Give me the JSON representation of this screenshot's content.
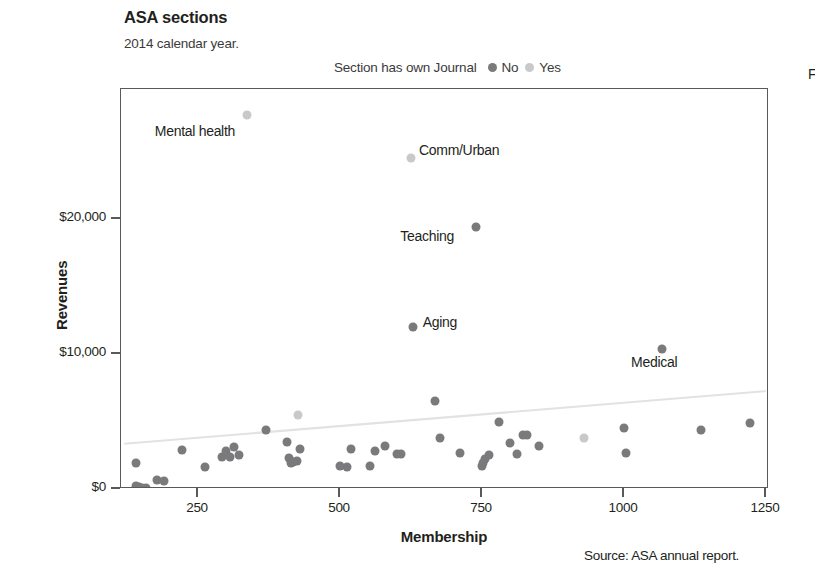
{
  "chart_data": {
    "type": "scatter",
    "title": "ASA sections",
    "subtitle": "2014 calendar year.",
    "xlabel": "Membership",
    "ylabel": "Revenues",
    "source": "Source: ASA annual report.",
    "grid": false,
    "legend_position": "top",
    "legend_title": "Section has own Journal",
    "xlim": [
      120,
      1300
    ],
    "ylim": [
      -1200,
      29000
    ],
    "xticks": [
      250,
      500,
      750,
      1000,
      1250
    ],
    "xtick_labels": [
      "250",
      "500",
      "750",
      "1000",
      "1250"
    ],
    "yticks": [
      0,
      10000,
      20000
    ],
    "ytick_labels": [
      "$0",
      "$10,000",
      "$20,000"
    ],
    "colors": {
      "no": "#7a7a7d",
      "yes": "#c9c9cb",
      "axis": "#58595b",
      "trend": "#e2e2e4",
      "text": "#231f20"
    },
    "series": [
      {
        "name": "No",
        "legend_label": "No",
        "color": "#7a7a7d",
        "points": [
          {
            "x": 140,
            "y": 200
          },
          {
            "x": 146,
            "y": 130
          },
          {
            "x": 152,
            "y": 100
          },
          {
            "x": 158,
            "y": 90
          },
          {
            "x": 140,
            "y": 1900
          },
          {
            "x": 178,
            "y": 700
          },
          {
            "x": 190,
            "y": 600
          },
          {
            "x": 222,
            "y": 2900
          },
          {
            "x": 262,
            "y": 1600
          },
          {
            "x": 292,
            "y": 2400
          },
          {
            "x": 300,
            "y": 2800
          },
          {
            "x": 306,
            "y": 2400
          },
          {
            "x": 314,
            "y": 3100
          },
          {
            "x": 322,
            "y": 2500
          },
          {
            "x": 370,
            "y": 4400
          },
          {
            "x": 406,
            "y": 3500
          },
          {
            "x": 410,
            "y": 2300
          },
          {
            "x": 414,
            "y": 1900
          },
          {
            "x": 418,
            "y": 2000
          },
          {
            "x": 424,
            "y": 2100
          },
          {
            "x": 430,
            "y": 3000
          },
          {
            "x": 500,
            "y": 1700
          },
          {
            "x": 512,
            "y": 1600
          },
          {
            "x": 520,
            "y": 3000
          },
          {
            "x": 552,
            "y": 1700
          },
          {
            "x": 562,
            "y": 2800
          },
          {
            "x": 580,
            "y": 3200
          },
          {
            "x": 600,
            "y": 2600
          },
          {
            "x": 608,
            "y": 2600
          },
          {
            "x": 668,
            "y": 6500
          },
          {
            "x": 676,
            "y": 3800
          },
          {
            "x": 712,
            "y": 2700
          },
          {
            "x": 750,
            "y": 1700
          },
          {
            "x": 752,
            "y": 1900
          },
          {
            "x": 756,
            "y": 2200
          },
          {
            "x": 762,
            "y": 2500
          },
          {
            "x": 780,
            "y": 5000
          },
          {
            "x": 800,
            "y": 3400
          },
          {
            "x": 812,
            "y": 2600
          },
          {
            "x": 822,
            "y": 4000
          },
          {
            "x": 830,
            "y": 4000
          },
          {
            "x": 850,
            "y": 3200
          },
          {
            "x": 1000,
            "y": 4500
          },
          {
            "x": 1004,
            "y": 2700
          },
          {
            "x": 1135,
            "y": 4400
          },
          {
            "x": 1222,
            "y": 4900
          },
          {
            "x": 1067,
            "y": 10400,
            "label": "Medical",
            "label_pos": "below"
          },
          {
            "x": 628,
            "y": 12000,
            "label": "Aging",
            "label_pos": "right"
          },
          {
            "x": 740,
            "y": 19400,
            "label": "Teaching",
            "label_pos": "left"
          }
        ]
      },
      {
        "name": "Yes",
        "legend_label": "Yes",
        "color": "#c9c9cb",
        "points": [
          {
            "x": 426,
            "y": 5500
          },
          {
            "x": 930,
            "y": 3800
          },
          {
            "x": 336,
            "y": 27700,
            "label": "Mental health",
            "label_pos": "below-left"
          },
          {
            "x": 625,
            "y": 24500,
            "label": "Comm/Urban",
            "label_pos": "right"
          }
        ]
      }
    ],
    "trendline": {
      "color": "#e2e2e4",
      "x_start": 120,
      "y_start": 3350,
      "x_end": 1250,
      "y_end": 7250
    },
    "annotations": [
      {
        "text": "Mental health",
        "x": 336,
        "y": 27700
      },
      {
        "text": "Comm/Urban",
        "x": 625,
        "y": 24500
      },
      {
        "text": "Teaching",
        "x": 740,
        "y": 19400
      },
      {
        "text": "Aging",
        "x": 628,
        "y": 12000
      },
      {
        "text": "Medical",
        "x": 1067,
        "y": 10400
      }
    ]
  },
  "labels": {
    "mental_health": "Mental health",
    "comm_urban": "Comm/Urban",
    "teaching": "Teaching",
    "aging": "Aging",
    "medical": "Medical"
  },
  "legend": {
    "title": "Section has own Journal",
    "no": "No",
    "yes": "Yes"
  },
  "axes": {
    "y_title": "Revenues",
    "x_title": "Membership",
    "y_ticks": [
      "$20,000",
      "$10,000",
      "$0"
    ],
    "x_ticks": [
      "250",
      "500",
      "750",
      "1000",
      "1250"
    ]
  },
  "header": {
    "title": "ASA sections",
    "subtitle": "2014 calendar year."
  },
  "footer": {
    "source": "Source: ASA annual report."
  },
  "edge": {
    "clipped_glyph": "F"
  }
}
